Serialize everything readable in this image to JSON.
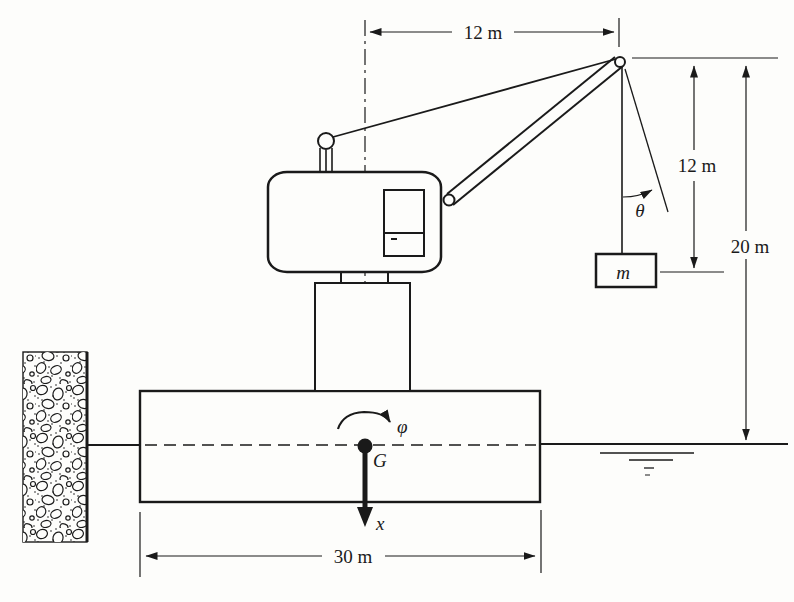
{
  "figure": {
    "colors": {
      "background": "#fdfdfb",
      "ink": "#1a1a1a"
    },
    "dimensions": {
      "boom_reach": "12 m",
      "cable_length": "12 m",
      "height_above_water": "20 m",
      "barge_length": "30 m"
    },
    "symbols": {
      "pendulum_angle": "θ",
      "roll_angle": "φ",
      "load_mass": "m",
      "center_of_gravity": "G",
      "x_axis": "x"
    }
  }
}
